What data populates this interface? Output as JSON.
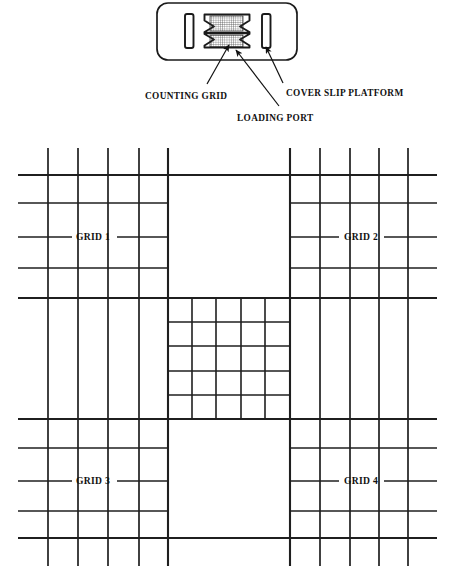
{
  "figure": {
    "background_color": "#ffffff",
    "line_color": "#1a1a1a"
  },
  "device": {
    "name": "hemocytometer-slide",
    "shape": "rounded-rectangle",
    "bar_left_name": "cover-slip-platform-left-bar",
    "bar_right_name": "cover-slip-platform-right-bar",
    "chamber_name": "h-shaped-chamber",
    "grid_top_name": "counting-grid-upper",
    "grid_bottom_name": "counting-grid-lower"
  },
  "callouts": [
    {
      "id": "counting-grid",
      "label": "COUNTING GRID",
      "text_x": 145,
      "text_y": 99,
      "leader_from_x": 207,
      "leader_from_y": 84,
      "leader_to_x": 229,
      "leader_to_y": 45,
      "arrow": true
    },
    {
      "id": "loading-port",
      "label": "LOADING PORT",
      "text_x": 237,
      "text_y": 121,
      "leader_from_x": 279,
      "leader_from_y": 106,
      "leader_to_x": 236,
      "leader_to_y": 50,
      "arrow": true
    },
    {
      "id": "cover-slip-platform",
      "label": "COVER SLIP PLATFORM",
      "text_x": 286,
      "text_y": 96,
      "leader_from_x": 283,
      "leader_from_y": 83,
      "leader_to_x": 266,
      "leader_to_y": 47,
      "arrow": true
    }
  ],
  "main_grid": {
    "bounds": {
      "x0": 18,
      "y0": 148,
      "x1": 437,
      "y1": 566
    },
    "horizontal_extent": {
      "x_start": 18,
      "x_end": 437
    },
    "vertical_extent": {
      "y_start": 148,
      "y_end": 566
    },
    "left_verticals": [
      48,
      78,
      108,
      139,
      168
    ],
    "right_verticals": [
      290,
      320,
      350,
      379,
      408
    ],
    "top_horizontals": [
      175,
      203,
      237,
      268,
      298
    ],
    "bottom_horizontals": [
      419,
      448,
      481,
      511,
      538
    ],
    "center_block": {
      "x0": 168,
      "y0": 298,
      "x1": 290,
      "y1": 419
    },
    "center_cells": 5,
    "center_verticals": [
      192,
      216,
      241,
      265
    ],
    "center_horizontals": [
      322,
      346,
      371,
      395
    ],
    "quadrant_labels": [
      {
        "id": "grid-1",
        "label": "GRID 1",
        "x": 93,
        "y": 240,
        "line_y": 237,
        "line_x0": 18,
        "line_x1": 168
      },
      {
        "id": "grid-2",
        "label": "GRID 2",
        "x": 360,
        "y": 240,
        "line_y": 237,
        "line_x0": 290,
        "line_x1": 437
      },
      {
        "id": "grid-3",
        "label": "GRID 3",
        "x": 93,
        "y": 484,
        "line_y": 481,
        "line_x0": 18,
        "line_x1": 168
      },
      {
        "id": "grid-4",
        "label": "GRID 4",
        "x": 360,
        "y": 484,
        "line_y": 481,
        "line_x0": 290,
        "line_x1": 437
      }
    ]
  }
}
